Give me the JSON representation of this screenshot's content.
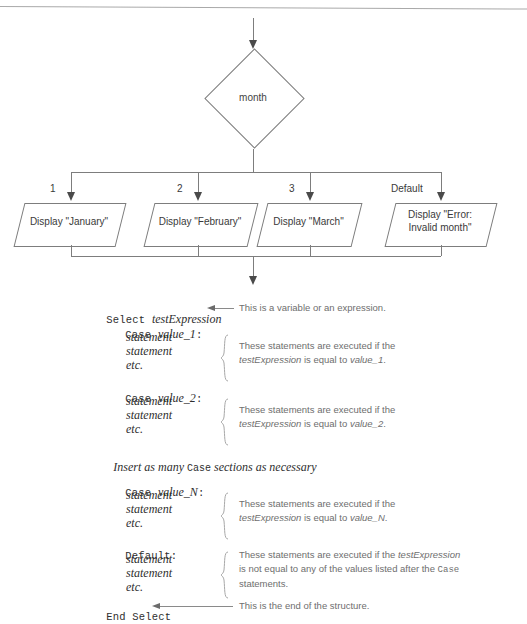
{
  "flowchart": {
    "decision": {
      "label": "month"
    },
    "branches": [
      {
        "label": "1",
        "text": "Display \"January\""
      },
      {
        "label": "2",
        "text": "Display \"February\""
      },
      {
        "label": "3",
        "text": "Display \"March\""
      },
      {
        "label": "Default",
        "text": "Display \"Error:\nInvalid month\""
      }
    ]
  },
  "code": {
    "lines": [
      {
        "id": "select",
        "kw": "Select",
        "arg": "testExpression",
        "punct": ""
      },
      {
        "id": "case1",
        "kw": "Case",
        "arg": "value_1",
        "punct": ":"
      },
      {
        "id": "stmt1a",
        "kw": "",
        "arg": "statement",
        "punct": ""
      },
      {
        "id": "stmt1b",
        "kw": "",
        "arg": "statement",
        "punct": ""
      },
      {
        "id": "etc1",
        "kw": "",
        "arg": "etc.",
        "punct": ""
      },
      {
        "id": "case2",
        "kw": "Case",
        "arg": "value_2",
        "punct": ":"
      },
      {
        "id": "stmt2a",
        "kw": "",
        "arg": "statement",
        "punct": ""
      },
      {
        "id": "stmt2b",
        "kw": "",
        "arg": "statement",
        "punct": ""
      },
      {
        "id": "etc2",
        "kw": "",
        "arg": "etc.",
        "punct": ""
      },
      {
        "id": "caseN",
        "kw": "Case",
        "arg": "value_N",
        "punct": ":"
      },
      {
        "id": "stmtNa",
        "kw": "",
        "arg": "statement",
        "punct": ""
      },
      {
        "id": "stmtNb",
        "kw": "",
        "arg": "statement",
        "punct": ""
      },
      {
        "id": "etcN",
        "kw": "",
        "arg": "etc.",
        "punct": ""
      },
      {
        "id": "default",
        "kw": "Default:",
        "arg": "",
        "punct": ""
      },
      {
        "id": "stmtDa",
        "kw": "",
        "arg": "statement",
        "punct": ""
      },
      {
        "id": "stmtDb",
        "kw": "",
        "arg": "statement",
        "punct": ""
      },
      {
        "id": "etcD",
        "kw": "",
        "arg": "etc.",
        "punct": ""
      },
      {
        "id": "endselect",
        "kw": "End Select",
        "arg": "",
        "punct": ""
      }
    ],
    "insert_note_a": "Insert as many ",
    "insert_note_kw": "Case",
    "insert_note_b": " sections as necessary"
  },
  "annotations": {
    "select_note": "This is a variable or an expression.",
    "case1_note_a": "These statements are executed if the",
    "case1_note_b1": "testExpression",
    "case1_note_b2": " is equal to ",
    "case1_note_b3": "value_1",
    "case1_note_b4": ".",
    "case2_note_a": "These statements are executed if the",
    "case2_note_b1": "testExpression",
    "case2_note_b2": " is equal to ",
    "case2_note_b3": "value_2",
    "case2_note_b4": ".",
    "caseN_note_a": "These statements are executed if the",
    "caseN_note_b1": "testExpression",
    "caseN_note_b2": " is equal to ",
    "caseN_note_b3": "value_N",
    "caseN_note_b4": ".",
    "default_note_a1": "These statements are executed if the ",
    "default_note_a2": "testExpression",
    "default_note_b1": "is not equal to any of the values listed after the ",
    "default_note_b2": "Case",
    "default_note_c": "statements.",
    "end_note": "This is the end of the structure."
  },
  "colors": {
    "stroke": "#7d7d7d",
    "arrow": "#4a4a4a",
    "code_text": "#2e2e2e",
    "annot_text": "#6e6e6e",
    "background": "#ffffff"
  }
}
